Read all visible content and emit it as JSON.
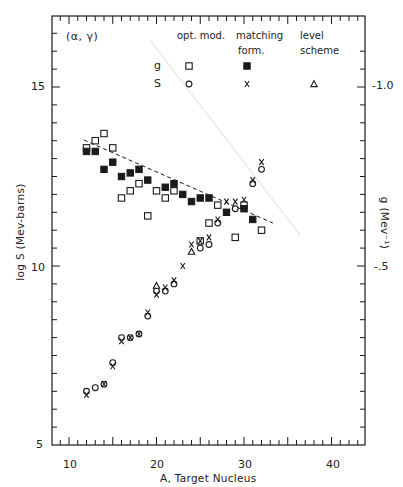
{
  "chart_data": {
    "type": "scatter",
    "title": "(α, γ)",
    "xlabel": "A, Target Nucleus",
    "ylabel": "log S (Mev-barns)",
    "ylabel_right": "g (Mev⁻¹)",
    "xlim": [
      8,
      43.8
    ],
    "ylim": [
      5,
      17
    ],
    "ylim_right": [
      0,
      -1.2
    ],
    "x_ticks": [
      10,
      20,
      30,
      40
    ],
    "y_ticks": [
      5,
      10,
      15
    ],
    "y_ticks_right": [
      -1.0,
      -0.5
    ],
    "y_tick_labels_right": [
      "-1.0",
      "-.5"
    ],
    "grid": false,
    "legend": {
      "columns": [
        "opt. mod.",
        "matching form.",
        "level scheme"
      ],
      "column_lines": [
        [
          "opt. mod."
        ],
        [
          "matching",
          "form."
        ],
        [
          "level",
          "scheme"
        ]
      ],
      "rows": [
        "g",
        "S"
      ],
      "symbols": {
        "g": [
          "open-square",
          "filled-square",
          ""
        ],
        "S": [
          "open-circle",
          "x-mark",
          "open-triangle"
        ]
      }
    },
    "series": [
      {
        "name": "g, opt. mod.",
        "axis": "right",
        "marker": "open-square",
        "x": [
          12,
          13,
          14,
          15,
          16,
          17,
          18,
          19,
          20,
          21,
          22,
          25,
          26,
          27,
          29,
          30,
          32
        ],
        "y": [
          -0.83,
          -0.85,
          -0.87,
          -0.83,
          -0.69,
          -0.71,
          -0.73,
          -0.64,
          -0.71,
          -0.69,
          -0.71,
          -0.57,
          -0.62,
          -0.67,
          -0.58,
          -0.67,
          -0.6
        ]
      },
      {
        "name": "g, matching form.",
        "axis": "right",
        "marker": "filled-square",
        "x": [
          12,
          13,
          14,
          15,
          16,
          17,
          18,
          19,
          21,
          22,
          23,
          24,
          25,
          26,
          28,
          30,
          31
        ],
        "y": [
          -0.82,
          -0.82,
          -0.77,
          -0.79,
          -0.75,
          -0.76,
          -0.77,
          -0.74,
          -0.72,
          -0.73,
          -0.7,
          -0.68,
          -0.69,
          -0.69,
          -0.65,
          -0.66,
          -0.63
        ]
      },
      {
        "name": "S, opt. mod.",
        "axis": "left",
        "marker": "open-circle",
        "x": [
          12,
          13,
          14,
          15,
          16,
          17,
          18,
          19,
          20,
          21,
          22,
          25,
          26,
          27,
          29,
          31,
          32
        ],
        "y": [
          6.5,
          6.6,
          6.7,
          7.3,
          8.0,
          8.0,
          8.1,
          8.6,
          9.3,
          9.3,
          9.5,
          10.5,
          10.6,
          11.2,
          11.6,
          12.3,
          12.7
        ]
      },
      {
        "name": "S, matching form.",
        "axis": "left",
        "marker": "x-mark",
        "x": [
          12,
          14,
          15,
          16,
          17,
          18,
          19,
          20,
          21,
          22,
          23,
          24,
          25,
          26,
          27,
          28,
          29,
          30,
          31,
          32
        ],
        "y": [
          6.4,
          6.7,
          7.2,
          7.9,
          8.0,
          8.1,
          8.7,
          9.2,
          9.4,
          9.6,
          10.0,
          10.6,
          10.7,
          10.8,
          11.3,
          11.8,
          11.8,
          11.85,
          12.4,
          12.9
        ]
      },
      {
        "name": "S, level scheme",
        "axis": "left",
        "marker": "open-triangle",
        "x": [
          20,
          24
        ],
        "y": [
          9.45,
          10.4
        ]
      }
    ],
    "fit_line": {
      "name": "g trend (dashed)",
      "axis": "right",
      "style": "dashed",
      "x": [
        11.7,
        33.3
      ],
      "y": [
        -0.852,
        -0.62
      ]
    }
  }
}
